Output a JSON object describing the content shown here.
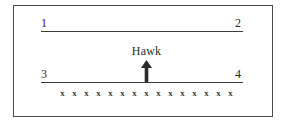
{
  "figure": {
    "frame_color": "#4a4a4a",
    "line_color": "#3c3c3c",
    "text_color": "#2b2b2b"
  },
  "diagram": {
    "top_line": {
      "left_label": "1",
      "right_label": "2"
    },
    "bottom_line": {
      "left_label": "3",
      "right_label": "4"
    },
    "annotation": {
      "label": "Hawk",
      "marker": "up-arrow"
    },
    "x_marks": {
      "symbol": "x",
      "count": 15,
      "items": [
        "x",
        "x",
        "x",
        "x",
        "x",
        "x",
        "x",
        "x",
        "x",
        "x",
        "x",
        "x",
        "x",
        "x",
        "x"
      ]
    }
  }
}
